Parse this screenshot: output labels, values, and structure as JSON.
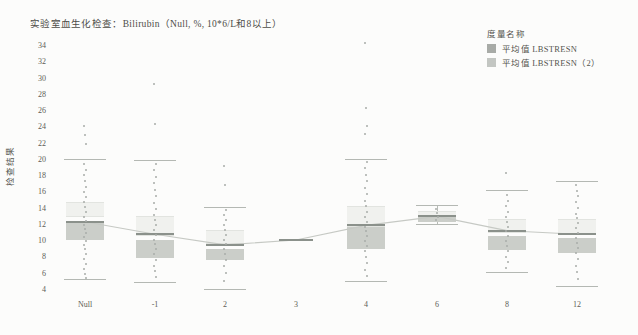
{
  "chart_data": {
    "type": "box",
    "title": "实验室血生化检查：Bilirubin（Null, %, 10*6/L和8以上）",
    "ylabel": "检查结果",
    "ylim": [
      4,
      34
    ],
    "y_ticks": [
      34,
      32,
      30,
      28,
      26,
      24,
      22,
      20,
      18,
      16,
      14,
      12,
      10,
      8,
      6,
      4
    ],
    "grid": "off",
    "legend_position": "top-right",
    "legend_title": "度量名称",
    "legend": [
      {
        "label": "平均值 LBSTRESN",
        "color": "#a8aba7"
      },
      {
        "label": "平均值 LBSTRESN（2）",
        "color": "#c3c6c2"
      }
    ],
    "colors": {
      "light_box": "#f0f1ee",
      "dark_box": "#cbcec9",
      "mean_line": "#8b918b",
      "cap": "#b4b8b3",
      "dot": "#a9ada9",
      "trend": "#c6c9c4"
    },
    "categories": [
      {
        "label": "Null",
        "x": 85,
        "cap_top": 20.0,
        "cap_bottom": 5.3,
        "light_box": [
          13.2,
          14.85
        ],
        "dark_box": [
          10.2,
          12.35
        ],
        "mean": 12.4,
        "outliers": [
          24.2,
          23.1,
          22.0
        ],
        "dots": [
          19.5,
          18.8,
          18.1,
          17.4,
          16.7,
          16.0,
          15.4,
          14.8,
          14.2,
          13.6,
          13.0,
          12.5,
          12.0,
          11.5,
          11.0,
          10.5,
          10.0,
          9.5,
          9.0,
          8.4,
          7.8,
          7.2,
          6.6,
          6.0,
          5.5
        ]
      },
      {
        "label": "-1",
        "x": 155,
        "cap_top": 19.9,
        "cap_bottom": 4.9,
        "light_box": [
          10.9,
          13.1
        ],
        "dark_box": [
          7.9,
          10.2
        ],
        "mean": 10.85,
        "outliers": [
          29.3,
          24.4
        ],
        "dots": [
          19.5,
          18.7,
          17.9,
          17.1,
          16.3,
          15.5,
          14.7,
          13.9,
          13.2,
          12.6,
          12.0,
          11.4,
          10.8,
          10.2,
          9.6,
          9.0,
          8.4,
          7.7,
          7.0,
          6.3,
          5.6
        ]
      },
      {
        "label": "2",
        "x": 225,
        "cap_top": 14.1,
        "cap_bottom": 4.1,
        "light_box": [
          9.9,
          11.4
        ],
        "dark_box": [
          7.7,
          9.1
        ],
        "mean": 9.55,
        "outliers": [
          19.2,
          16.9
        ],
        "dots": [
          13.8,
          13.2,
          12.6,
          12.0,
          11.4,
          10.8,
          10.2,
          9.6,
          9.0,
          8.4,
          7.7,
          7.0,
          6.1,
          5.1
        ]
      },
      {
        "label": "3",
        "x": 296,
        "cap_top": null,
        "cap_bottom": null,
        "light_box": null,
        "dark_box": null,
        "mean": 10.15,
        "outliers": [],
        "dots": [],
        "narrow": true
      },
      {
        "label": "4",
        "x": 366,
        "cap_top": 20.1,
        "cap_bottom": 5.0,
        "light_box": [
          12.0,
          14.3
        ],
        "dark_box": [
          9.1,
          11.8
        ],
        "mean": 11.95,
        "outliers": [
          34.4,
          26.4,
          24.2,
          23.2
        ],
        "dots": [
          19.7,
          19.0,
          18.2,
          17.4,
          16.6,
          15.8,
          15.0,
          14.3,
          13.6,
          13.0,
          12.4,
          11.8,
          11.2,
          10.6,
          10.0,
          9.4,
          8.8,
          8.1,
          7.3,
          6.5,
          5.7
        ]
      },
      {
        "label": "6",
        "x": 437,
        "cap_top": 14.4,
        "cap_bottom": 12.0,
        "light_box": [
          13.1,
          13.7
        ],
        "dark_box": [
          12.4,
          13.1
        ],
        "mean": 13.05,
        "outliers": [],
        "dots": [
          14.0,
          13.5,
          13.0,
          12.6
        ],
        "whisker_line": true
      },
      {
        "label": "8",
        "x": 507,
        "cap_top": 16.2,
        "cap_bottom": 6.1,
        "light_box": [
          11.3,
          12.7
        ],
        "dark_box": [
          8.9,
          10.65
        ],
        "mean": 11.3,
        "outliers": [
          18.4
        ],
        "dots": [
          15.7,
          15.0,
          14.3,
          13.6,
          13.0,
          12.4,
          11.8,
          11.2,
          10.6,
          10.0,
          9.4,
          8.8,
          8.1,
          7.4,
          6.7
        ]
      },
      {
        "label": "12",
        "x": 577,
        "cap_top": 17.3,
        "cap_bottom": 4.4,
        "light_box": [
          11.0,
          12.7
        ],
        "dark_box": [
          8.6,
          10.4
        ],
        "mean": 10.85,
        "outliers": [],
        "dots": [
          16.9,
          16.2,
          15.5,
          14.8,
          14.1,
          13.4,
          12.8,
          12.2,
          11.6,
          11.0,
          10.4,
          9.8,
          9.2,
          8.5,
          7.8,
          7.0,
          6.2,
          5.3
        ]
      }
    ]
  }
}
